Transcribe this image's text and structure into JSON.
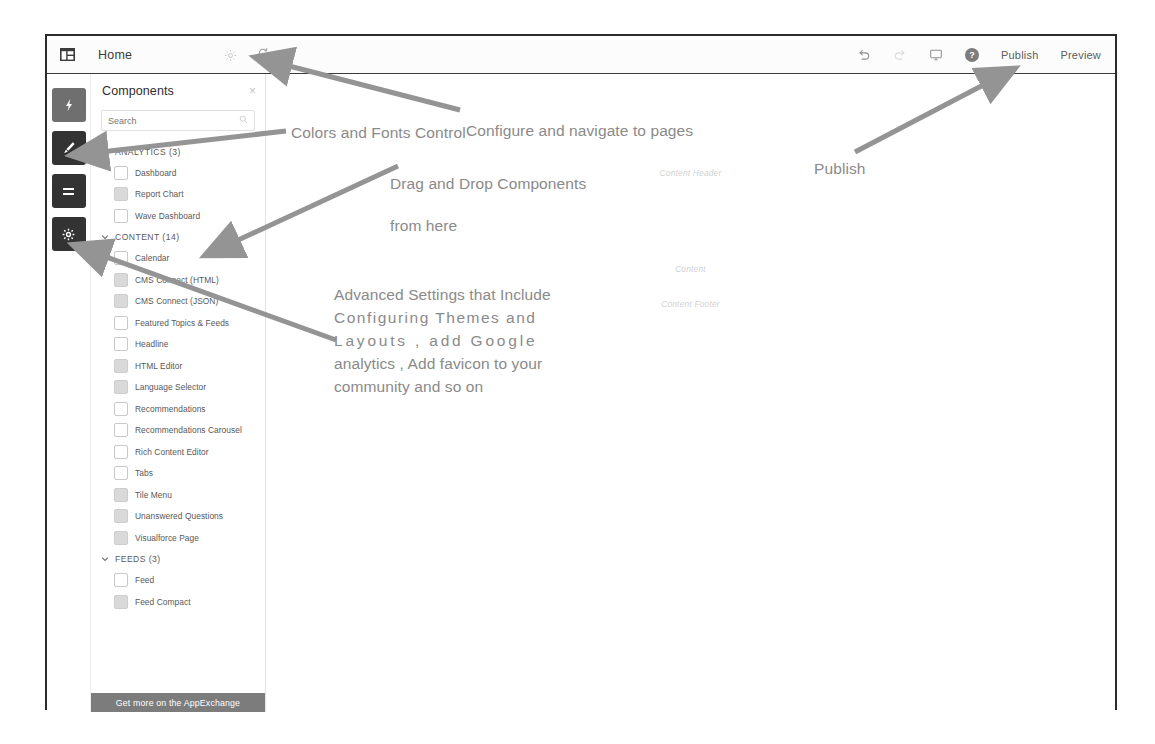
{
  "header": {
    "logo_icon": "community-builder-logo-icon",
    "page_name": "Home",
    "gear_icon": "page-settings-gear-icon",
    "refresh_icon": "refresh-icon",
    "undo_icon": "undo-icon",
    "redo_icon": "redo-icon",
    "device_icon": "desktop-preview-icon",
    "help_icon": "help-icon",
    "help_glyph": "?",
    "publish_label": "Publish",
    "preview_label": "Preview"
  },
  "rail": {
    "items": [
      {
        "name": "lightning-bolt-icon",
        "tooltip": "Components"
      },
      {
        "name": "brush-icon",
        "tooltip": "Theme"
      },
      {
        "name": "lines-icon",
        "tooltip": "Page Structure"
      },
      {
        "name": "gear-icon",
        "tooltip": "Settings"
      }
    ]
  },
  "panel": {
    "title": "Components",
    "close_glyph": "×",
    "search_placeholder": "Search",
    "search_value": "",
    "search_icon": "search-icon",
    "footer_label": "Get more on the AppExchange",
    "groups": [
      {
        "label": "ANALYTICS (3)",
        "expanded": true,
        "items": [
          {
            "label": "Dashboard",
            "icon": "dashboard-component-icon",
            "style": "hollow"
          },
          {
            "label": "Report Chart",
            "icon": "report-chart-component-icon",
            "style": "filled"
          },
          {
            "label": "Wave Dashboard",
            "icon": "wave-dashboard-component-icon",
            "style": "hollow"
          }
        ]
      },
      {
        "label": "CONTENT (14)",
        "expanded": true,
        "items": [
          {
            "label": "Calendar",
            "icon": "calendar-component-icon",
            "style": "hollow"
          },
          {
            "label": "CMS Connect (HTML)",
            "icon": "cms-connect-html-component-icon",
            "style": "filled"
          },
          {
            "label": "CMS Connect (JSON)",
            "icon": "cms-connect-json-component-icon",
            "style": "filled"
          },
          {
            "label": "Featured Topics & Feeds",
            "icon": "featured-topics-feeds-component-icon",
            "style": "hollow"
          },
          {
            "label": "Headline",
            "icon": "headline-component-icon",
            "style": "hollow"
          },
          {
            "label": "HTML Editor",
            "icon": "html-editor-component-icon",
            "style": "filled"
          },
          {
            "label": "Language Selector",
            "icon": "language-selector-component-icon",
            "style": "filled"
          },
          {
            "label": "Recommendations",
            "icon": "recommendations-component-icon",
            "style": "hollow"
          },
          {
            "label": "Recommendations Carousel",
            "icon": "recommendations-carousel-component-icon",
            "style": "hollow"
          },
          {
            "label": "Rich Content Editor",
            "icon": "rich-content-editor-component-icon",
            "style": "hollow"
          },
          {
            "label": "Tabs",
            "icon": "tabs-component-icon",
            "style": "hollow"
          },
          {
            "label": "Tile Menu",
            "icon": "tile-menu-component-icon",
            "style": "filled"
          },
          {
            "label": "Unanswered Questions",
            "icon": "unanswered-questions-component-icon",
            "style": "filled"
          },
          {
            "label": "Visualforce Page",
            "icon": "visualforce-page-component-icon",
            "style": "filled"
          }
        ]
      },
      {
        "label": "FEEDS (3)",
        "expanded": true,
        "items": [
          {
            "label": "Feed",
            "icon": "feed-component-icon",
            "style": "hollow"
          },
          {
            "label": "Feed Compact",
            "icon": "feed-compact-component-icon",
            "style": "filled"
          }
        ]
      }
    ]
  },
  "canvas": {
    "content_header": "Content Header",
    "content": "Content",
    "content_footer": "Content Footer"
  },
  "annotations": {
    "configure": "Configure and navigate to pages",
    "colors": "Colors and Fonts Control",
    "drag_line1": "Drag and Drop Components",
    "drag_line2": "from here",
    "publish": "Publish",
    "advanced_line1": "Advanced Settings that Include",
    "advanced_line2": "Configuring Themes and",
    "advanced_line3": "Layouts , add Google",
    "advanced_line4": "analytics , Add favicon to your",
    "advanced_line5": "community and so on"
  },
  "colors": {
    "frame_border": "#2b2b2b",
    "rail_button": "#4a4a4a",
    "panel_footer": "#7c7c7c",
    "annotation_text": "#8a8a8a",
    "arrow": "#8d8d8d",
    "canvas_placeholder": "#d2d2d2"
  }
}
